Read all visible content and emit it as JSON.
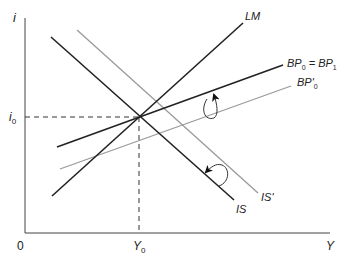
{
  "diagram": {
    "type": "IS-LM-BP",
    "axes": {
      "y_label": "i",
      "x_label": "Y",
      "origin_label": "0",
      "y_tick_label": "i",
      "y_tick_sub": "0",
      "x_tick_label": "Y",
      "x_tick_sub": "0"
    },
    "curves": {
      "lm": {
        "label": "LM",
        "color": "#222222"
      },
      "bp0": {
        "label_main": "BP",
        "sub1": "0",
        "eq": " = BP",
        "sub2": "1",
        "color": "#222222"
      },
      "bp0_prime": {
        "label_main": "BP'",
        "sub": "0",
        "color": "#9a9a9a"
      },
      "is": {
        "label": "IS",
        "color": "#222222"
      },
      "is_prime": {
        "label": "IS'",
        "color": "#9a9a9a"
      }
    },
    "arrows": [
      {
        "name": "bp-shift-arrow",
        "from": "BP'0",
        "to": "BP0 = BP1"
      },
      {
        "name": "is-shift-arrow",
        "from": "IS'",
        "to": "IS"
      }
    ]
  }
}
